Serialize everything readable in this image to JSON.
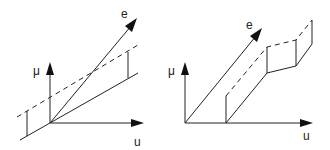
{
  "figure": {
    "panels": [
      {
        "id": "left",
        "labels": {
          "mu": "μ",
          "e": "e",
          "u": "u"
        },
        "origin": [
          50,
          123
        ],
        "axes": {
          "mu_tip": [
            50,
            62
          ],
          "u_tip": [
            144,
            123
          ],
          "e_tip": [
            137,
            18
          ]
        },
        "solid_line": [
          [
            20,
            140
          ],
          [
            138,
            73
          ]
        ],
        "dashed_line": [
          [
            17,
            117
          ],
          [
            138,
            45
          ]
        ],
        "verticals": [
          [
            [
              27,
              111
            ],
            [
              27,
              136
            ]
          ],
          [
            [
              128,
              52
            ],
            [
              128,
              78
            ]
          ]
        ]
      },
      {
        "id": "right",
        "labels": {
          "mu": "μ",
          "e": "e",
          "u": "u"
        },
        "origin": [
          185,
          123
        ],
        "axes": {
          "mu_tip": [
            185,
            62
          ],
          "u_tip": [
            313,
            123
          ],
          "e_tip": [
            262,
            28
          ]
        },
        "solid_path": [
          [
            226,
            123
          ],
          [
            267,
            73
          ],
          [
            296,
            66
          ],
          [
            312,
            44
          ]
        ],
        "dashed_path": [
          [
            226,
            96
          ],
          [
            267,
            47
          ],
          [
            296,
            40
          ],
          [
            312,
            20
          ]
        ],
        "verticals": [
          [
            [
              226,
              123
            ],
            [
              226,
              96
            ]
          ],
          [
            [
              267,
              73
            ],
            [
              267,
              47
            ]
          ],
          [
            [
              296,
              66
            ],
            [
              296,
              40
            ]
          ],
          [
            [
              312,
              44
            ],
            [
              312,
              20
            ]
          ]
        ]
      }
    ],
    "colors": {
      "stroke": "#222222",
      "background": "#ffffff"
    }
  }
}
